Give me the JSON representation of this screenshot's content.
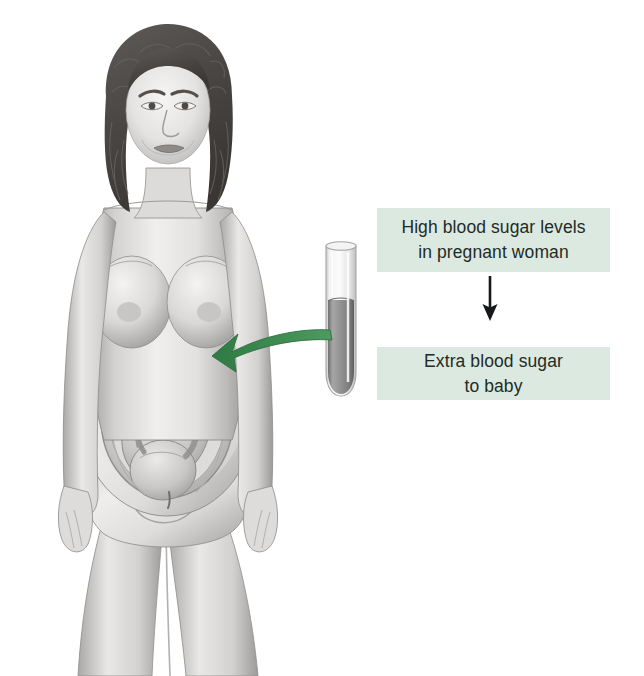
{
  "page": {
    "background_color": "#ffffff",
    "width": 644,
    "height": 676
  },
  "illustration": {
    "name": "pregnant-woman-cutaway-illustration",
    "description": "Grayscale pencil illustration of a nude pregnant woman, front view, with a cutaway of the uterus revealing a head-down fetus",
    "style": "grayscale-medical-drawing",
    "parts": [
      {
        "name": "head-with-curly-hair",
        "label": "Head"
      },
      {
        "name": "face",
        "label": "Face"
      },
      {
        "name": "torso",
        "label": "Torso"
      },
      {
        "name": "pregnant-abdomen-cutaway",
        "label": "Pregnant abdomen"
      },
      {
        "name": "uterus",
        "label": "Uterus"
      },
      {
        "name": "placenta",
        "label": "Placenta"
      },
      {
        "name": "fetus",
        "label": "Fetus"
      },
      {
        "name": "umbilical-cord",
        "label": "Umbilical cord"
      },
      {
        "name": "left-arm",
        "label": "Left arm"
      },
      {
        "name": "right-arm",
        "label": "Right arm"
      },
      {
        "name": "legs",
        "label": "Legs"
      }
    ],
    "colors": {
      "skin_light": "#f2f1ef",
      "skin_mid": "#c9c8c6",
      "skin_shadow": "#8f8e8d",
      "hair_dark": "#4a4745",
      "outline": "#6e6c6a"
    }
  },
  "test_tube": {
    "name": "blood-sample-test-tube",
    "label": "Test tube of blood sample",
    "glass_color": "#e9e9e9",
    "liquid_color": "#8d8d8d",
    "rim_color": "#b4b4b4"
  },
  "green_arrow": {
    "name": "blood-sugar-transfer-arrow",
    "label": "Blood sugar passes from mother to baby",
    "color": "#3d8a52",
    "direction": "right-to-left-curved"
  },
  "flow": {
    "box_color": "#dce9e0",
    "text_color": "#1f2b26",
    "arrow_color": "#16181a",
    "steps": [
      {
        "name": "high-blood-sugar-step",
        "text": "High blood sugar levels\nin pregnant woman"
      },
      {
        "name": "extra-blood-sugar-step",
        "text": "Extra blood sugar\nto baby"
      }
    ],
    "arrow": {
      "name": "downward-flow-arrow",
      "label": "leads to"
    }
  }
}
